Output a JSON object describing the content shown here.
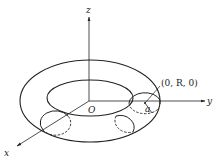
{
  "diagram": {
    "type": "torus-coordinate-figure",
    "axes": {
      "z": {
        "label": "z"
      },
      "y": {
        "label": "y"
      },
      "x": {
        "label": "x"
      },
      "origin": {
        "label": "O"
      }
    },
    "annotations": {
      "point": "(0, R, 0)",
      "radius": "a"
    },
    "colors": {
      "stroke": "#222222",
      "background": "#ffffff"
    }
  }
}
